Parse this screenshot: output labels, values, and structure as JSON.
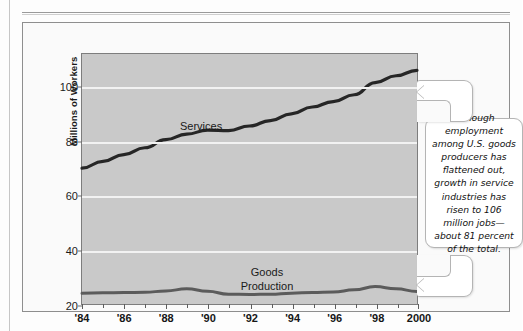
{
  "figure": {
    "background_color": "#fafafa",
    "plot_background_color": "#c9c9c9",
    "gridline_color": "#f2f2f2"
  },
  "callout": {
    "text": "Although employment among U.S. goods producers has flattened out, growth in service industries has risen to 106 million jobs—about 81 percent of the total."
  },
  "chart_data": {
    "type": "line",
    "title": "",
    "xlabel": "",
    "ylabel": "Millions of Workers",
    "xlim": [
      1984,
      2000
    ],
    "ylim": [
      20,
      112
    ],
    "yticks": [
      20,
      40,
      60,
      80,
      100
    ],
    "ytick_labels": [
      "20",
      "40",
      "60",
      "80",
      "100"
    ],
    "gridlines": [
      40,
      60,
      80,
      100
    ],
    "xticks": [
      1984,
      1986,
      1988,
      1990,
      1992,
      1994,
      1996,
      1998,
      2000
    ],
    "xtick_labels": [
      "'84",
      "'86",
      "'88",
      "'90",
      "'92",
      "'94",
      "'96",
      "'98",
      "2000"
    ],
    "minor_xticks": [
      1985,
      1987,
      1989,
      1991,
      1993,
      1995,
      1997,
      1999
    ],
    "x": [
      1984,
      1985,
      1986,
      1987,
      1988,
      1989,
      1990,
      1991,
      1992,
      1993,
      1994,
      1995,
      1996,
      1997,
      1998,
      1999,
      2000
    ],
    "series": [
      {
        "name": "Services",
        "label": "Services",
        "color": "#262626",
        "width": 3.2,
        "values": [
          70,
          72.5,
          75,
          77.5,
          80.5,
          82.5,
          84,
          83.8,
          85.5,
          87.5,
          90,
          92.5,
          94.5,
          97,
          101.5,
          104,
          106
        ]
      },
      {
        "name": "Goods Production",
        "label": "Goods\nProduction",
        "label_line1": "Goods",
        "label_line2": "Production",
        "color": "#5b5b5b",
        "width": 3.0,
        "values": [
          24,
          24.1,
          24.2,
          24.3,
          24.8,
          25.6,
          24.7,
          23.6,
          23.5,
          23.6,
          24,
          24.2,
          24.4,
          25.2,
          26.4,
          25.6,
          24.6
        ]
      }
    ],
    "legend": "inline-labels",
    "grid": true
  }
}
